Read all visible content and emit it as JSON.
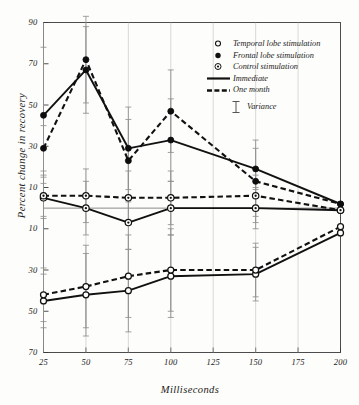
{
  "chart_data": {
    "type": "line",
    "title": "",
    "xlabel": "Milliseconds",
    "ylabel": "Percent change in recovery",
    "x": [
      25,
      50,
      75,
      100,
      125,
      150,
      175,
      200
    ],
    "xtick_labels": [
      "25",
      "50",
      "75",
      "100",
      "125",
      "150",
      "175",
      "200"
    ],
    "ytick_labels": [
      "90",
      "70",
      "50",
      "30",
      "10",
      "10",
      "30",
      "50",
      "70"
    ],
    "ytick_values": [
      90,
      70,
      50,
      30,
      10,
      -10,
      -30,
      -50,
      -70
    ],
    "ylim": [
      -70,
      90
    ],
    "xlim": [
      25,
      200
    ],
    "grid": false,
    "legend_position": "upper-right-inside",
    "legend": [
      {
        "marker": "open-circle",
        "label": "Temporal lobe stimulation"
      },
      {
        "marker": "filled-circle",
        "label": "Frontal lobe stimulation"
      },
      {
        "marker": "circled-dot",
        "label": "Control stimulation"
      },
      {
        "marker": "solid-line",
        "label": "Immediate"
      },
      {
        "marker": "dashed-line",
        "label": "One month"
      },
      {
        "marker": "error-bar",
        "label": "Variance"
      }
    ],
    "series": [
      {
        "name": "Frontal lobe stimulation — Immediate",
        "marker": "filled-circle",
        "line": "solid",
        "x": [
          25,
          50,
          75,
          100,
          150,
          200
        ],
        "values": [
          45,
          67,
          29,
          33,
          19,
          2
        ],
        "errors": [
          33,
          21,
          20,
          20,
          10,
          0
        ]
      },
      {
        "name": "Frontal lobe stimulation — One month",
        "marker": "filled-circle",
        "line": "dashed",
        "x": [
          25,
          50,
          75,
          100,
          150,
          200
        ],
        "values": [
          29,
          72,
          23,
          47,
          13,
          2
        ],
        "errors": [
          11,
          21,
          20,
          20,
          20,
          0
        ]
      },
      {
        "name": "Control stimulation — Immediate",
        "marker": "circled-dot",
        "line": "solid",
        "x": [
          25,
          50,
          75,
          100,
          150,
          200
        ],
        "values": [
          5,
          0,
          -7,
          0,
          0,
          -1
        ],
        "errors": [
          10,
          13,
          13,
          13,
          10,
          0
        ]
      },
      {
        "name": "Control stimulation — One month",
        "marker": "circled-dot",
        "line": "dashed",
        "x": [
          25,
          50,
          75,
          100,
          150,
          200
        ],
        "values": [
          6,
          6,
          5,
          5,
          6,
          -1
        ],
        "errors": [
          10,
          13,
          13,
          13,
          10,
          0
        ]
      },
      {
        "name": "Temporal lobe stimulation — Immediate",
        "marker": "open-circle",
        "line": "solid",
        "x": [
          25,
          50,
          75,
          100,
          150,
          200
        ],
        "values": [
          -45,
          -42,
          -40,
          -33,
          -32,
          -12
        ],
        "errors": [
          13,
          20,
          20,
          20,
          13,
          0
        ]
      },
      {
        "name": "Temporal lobe stimulation — One month",
        "marker": "open-circle",
        "line": "dashed",
        "x": [
          25,
          50,
          75,
          100,
          150,
          200
        ],
        "values": [
          -42,
          -38,
          -33,
          -30,
          -30,
          -9
        ],
        "errors": [
          13,
          20,
          20,
          20,
          13,
          0
        ]
      }
    ]
  }
}
